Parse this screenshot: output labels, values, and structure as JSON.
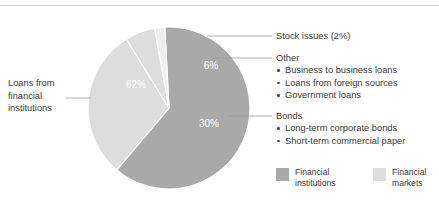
{
  "figure": {
    "title": "",
    "top_rule_color": "#d6d8da",
    "background": "#ffffff"
  },
  "chart_data": {
    "type": "pie",
    "title": "",
    "xlabel": "",
    "ylabel": "",
    "legend_position": "bottom-right",
    "grid": false,
    "categories": [
      "Loans from financial institutions",
      "Bonds",
      "Other",
      "Stock issues"
    ],
    "values": [
      62,
      30,
      6,
      2
    ],
    "value_labels": [
      "62%",
      "30%",
      "6%",
      "2%"
    ],
    "slice_colors": [
      "#a9a9a9",
      "#dddddd",
      "#dddddd",
      "#eeeeee"
    ],
    "slice_groups": [
      "Financial institutions",
      "Financial markets",
      "Financial markets",
      "Financial markets"
    ],
    "visible_slice_labels": [
      "62%",
      "30%",
      "6%"
    ],
    "annotations": [
      "Stock issues (2%)",
      "Other",
      "Bonds",
      "Loans from financial institutions"
    ]
  },
  "pie": {
    "center_x": 169,
    "center_y": 108,
    "radius": 81,
    "labels": {
      "major": "62%",
      "bonds": "30%",
      "other": "6%"
    }
  },
  "left_callout": {
    "line1": "Loans from",
    "line2": "financial",
    "line3": "institutions"
  },
  "callouts": {
    "stock": {
      "heading": "Stock issues (2%)"
    },
    "other": {
      "heading": "Other",
      "items": [
        "Business to business loans",
        "Loans from foreign sources",
        "Government loans"
      ]
    },
    "bonds": {
      "heading": "Bonds",
      "items": [
        "Long-term corporate bonds",
        "Short-term commercial paper"
      ]
    }
  },
  "legend": {
    "items": [
      {
        "label_line1": "Financial",
        "label_line2": "institutions",
        "color": "#a9a9a9"
      },
      {
        "label_line1": "Financial",
        "label_line2": "markets",
        "color": "#dddddd"
      }
    ]
  }
}
